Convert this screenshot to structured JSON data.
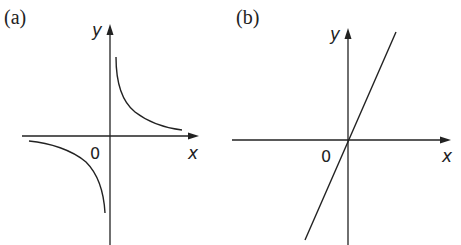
{
  "figure": {
    "panels": [
      {
        "id": "a",
        "label": "(a)",
        "x_axis_label": "x",
        "y_axis_label": "y",
        "origin_label": "0",
        "description": "Rectangular hyperbola y = k/x, branches in 1st and 3rd quadrants"
      },
      {
        "id": "b",
        "label": "(b)",
        "x_axis_label": "x",
        "y_axis_label": "y",
        "origin_label": "0",
        "description": "Straight line through origin with positive gradient"
      }
    ],
    "colors": {
      "ink": "#222222",
      "background": "#ffffff"
    }
  }
}
